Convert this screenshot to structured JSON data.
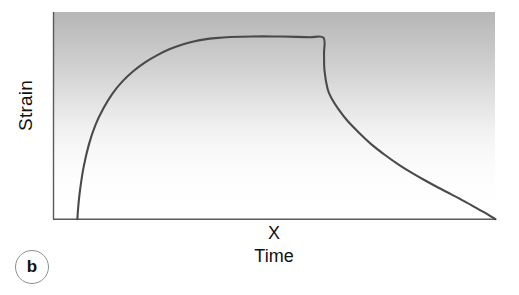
{
  "figure": {
    "panel_letter": "b",
    "y_axis_label": "Strain",
    "x_axis_label": "Time",
    "x_axis_marker": "X"
  },
  "colors": {
    "curve": "#4a4a4a",
    "axis": "#5a5a5a",
    "panel_gradient_top": "#b6b6b6",
    "panel_gradient_bottom": "#ffffff",
    "text": "#111111",
    "badge_border": "#8e8e8e",
    "background": "#ffffff"
  },
  "chart_data": {
    "type": "line",
    "title": "",
    "subtitle": "",
    "xlabel": "Time",
    "ylabel": "Strain",
    "annotations": [
      {
        "name": "panel-letter",
        "text": "b"
      },
      {
        "name": "x-axis-marker",
        "text": "X"
      }
    ],
    "grid": false,
    "legend": null,
    "xlim": [
      0,
      100
    ],
    "ylim": [
      0,
      100
    ],
    "axis_ticks": {
      "x": [],
      "y": []
    },
    "series": [
      {
        "name": "Creep and recovery strain",
        "color": "#4a4a4a",
        "phases": [
          {
            "name": "instantaneous-loading",
            "x_start": 5.4,
            "x_end": 6.6
          },
          {
            "name": "primary-creep",
            "x_start": 6.6,
            "x_end": 36.6
          },
          {
            "name": "steady-state-plateau",
            "x_start": 36.6,
            "x_end": 61.1
          },
          {
            "name": "instantaneous-recovery",
            "x_start": 61.1,
            "x_end": 62.7
          },
          {
            "name": "delayed-recovery",
            "x_start": 62.7,
            "x_end": 100.0
          }
        ],
        "x": [
          5.4,
          5.6,
          6.0,
          6.8,
          8.0,
          9.5,
          11.3,
          13.3,
          15.6,
          18.1,
          20.8,
          23.5,
          26.2,
          29.0,
          31.7,
          34.2,
          36.6,
          40.0,
          45.0,
          50.0,
          55.0,
          58.0,
          61.1,
          61.2,
          61.3,
          62.0,
          63.0,
          64.5,
          66.5,
          69.0,
          72.0,
          75.0,
          78.0,
          81.0,
          84.0,
          87.0,
          90.0,
          93.0,
          96.0,
          98.5,
          100.0
        ],
        "y": [
          0.0,
          6.0,
          14.0,
          25.0,
          36.0,
          45.5,
          53.5,
          60.5,
          66.5,
          71.5,
          75.8,
          79.2,
          82.0,
          84.2,
          85.8,
          86.8,
          87.4,
          87.9,
          88.2,
          88.2,
          88.0,
          87.8,
          87.6,
          80.0,
          72.0,
          63.0,
          58.0,
          53.0,
          47.5,
          42.0,
          36.0,
          31.0,
          26.5,
          22.5,
          18.8,
          15.3,
          12.0,
          8.6,
          5.0,
          2.0,
          0.0
        ]
      }
    ]
  }
}
